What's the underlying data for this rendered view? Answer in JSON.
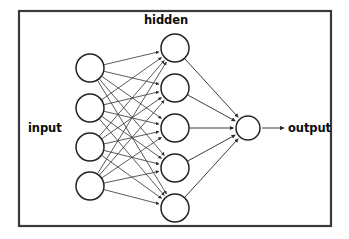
{
  "diagram": {
    "title": "hidden",
    "type": "neural-network-diagram",
    "background_color": "#ffffff",
    "frame": {
      "x": 19,
      "y": 11,
      "width": 312,
      "height": 215,
      "stroke_color": "#3a3a3c"
    },
    "labels": {
      "input": "input",
      "hidden": "hidden",
      "output": "output"
    },
    "node_style": {
      "fill": "#ffffff",
      "stroke": "#242424"
    },
    "edge_color": "#3c3c3c",
    "layers": [
      {
        "name": "input",
        "label": "input",
        "node_count": 4,
        "cx": 90,
        "radius": 14,
        "node_y": [
          68,
          108,
          147,
          186
        ]
      },
      {
        "name": "hidden",
        "label": "hidden",
        "node_count": 5,
        "cx": 175,
        "radius": 14,
        "node_y": [
          48,
          88,
          128,
          168,
          208
        ]
      },
      {
        "name": "output",
        "label": "output",
        "node_count": 1,
        "cx": 248,
        "radius": 12,
        "node_y": [
          128
        ]
      }
    ],
    "label_positions": {
      "input": {
        "x": 28,
        "y": 132
      },
      "hidden": {
        "x": 144,
        "y": 24
      },
      "output": {
        "x": 288,
        "y": 132
      }
    },
    "output_arrow": {
      "x1": 262,
      "x2": 284,
      "y": 128
    },
    "edge_counts": {
      "input_to_hidden": 20,
      "hidden_to_output": 5,
      "output_to_label": 1
    }
  }
}
